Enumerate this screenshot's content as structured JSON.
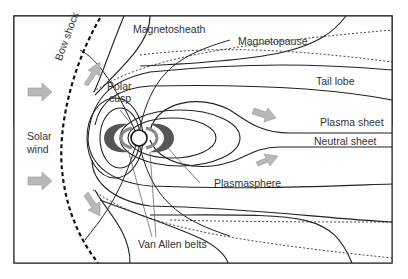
{
  "diagram": {
    "labels": {
      "magnetosheath": "Magnetosheath",
      "magnetopause": "Magnetopause",
      "bow_shock": "Bow shock",
      "polar_cusp_1": "Polar",
      "polar_cusp_2": "cusp",
      "tail_lobe": "Tail lobe",
      "plasma_sheet": "Plasma sheet",
      "neutral_sheet": "Neutral sheet",
      "solar_wind_1": "Solar",
      "solar_wind_2": "wind",
      "plasmasphere": "Plasmasphere",
      "van_allen_belts": "Van Allen belts"
    },
    "colors": {
      "line": "#222222",
      "arrow_fill": "#b8b8b8",
      "belt_fill": "#555555",
      "frame": "#333333"
    }
  }
}
